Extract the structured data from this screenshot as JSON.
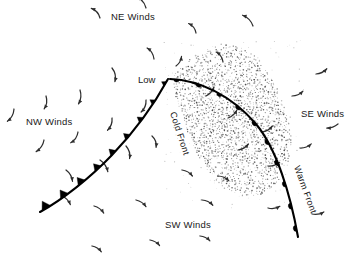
{
  "figure": {
    "background_color": "#ffffff",
    "ink_color": "#000000",
    "width": 354,
    "height": 254
  },
  "labels": {
    "low": "Low",
    "cold_front": "Cold Front",
    "warm_front": "Warm Front",
    "ne_winds": "NE Winds",
    "nw_winds": "NW Winds",
    "se_winds": "SE Winds",
    "sw_winds": "SW Winds"
  },
  "chart_data": {
    "type": "diagram",
    "low_center": {
      "label": "Low",
      "x": 168,
      "y": 79
    },
    "fronts": [
      {
        "name": "Cold Front",
        "symbol": "filled-triangles",
        "symbol_side": "left-of-travel",
        "start": {
          "x": 168,
          "y": 79
        },
        "end": {
          "x": 40,
          "y": 212
        },
        "pip_count": 9
      },
      {
        "name": "Warm Front",
        "symbol": "filled-semicircles",
        "symbol_side": "right-of-travel",
        "start": {
          "x": 172,
          "y": 79
        },
        "end": {
          "x": 298,
          "y": 237
        },
        "pip_count": 10
      }
    ],
    "precipitation_region": {
      "style": "stipple",
      "description": "stippled precipitation shield between and ahead of the fronts"
    },
    "wind_sectors": [
      {
        "label": "NE Winds",
        "x": 137,
        "y": 16,
        "quadrant": "north-east",
        "flow": "toward south-west"
      },
      {
        "label": "NW Winds",
        "x": 51,
        "y": 121,
        "quadrant": "north-west",
        "flow": "toward south-east"
      },
      {
        "label": "SE Winds",
        "x": 326,
        "y": 113,
        "quadrant": "south-east",
        "flow": "toward north-west"
      },
      {
        "label": "SW Winds",
        "x": 190,
        "y": 224,
        "quadrant": "south-west",
        "flow": "toward north-east"
      }
    ],
    "circulation": "counterclockwise (cyclonic, Northern Hemisphere)"
  }
}
